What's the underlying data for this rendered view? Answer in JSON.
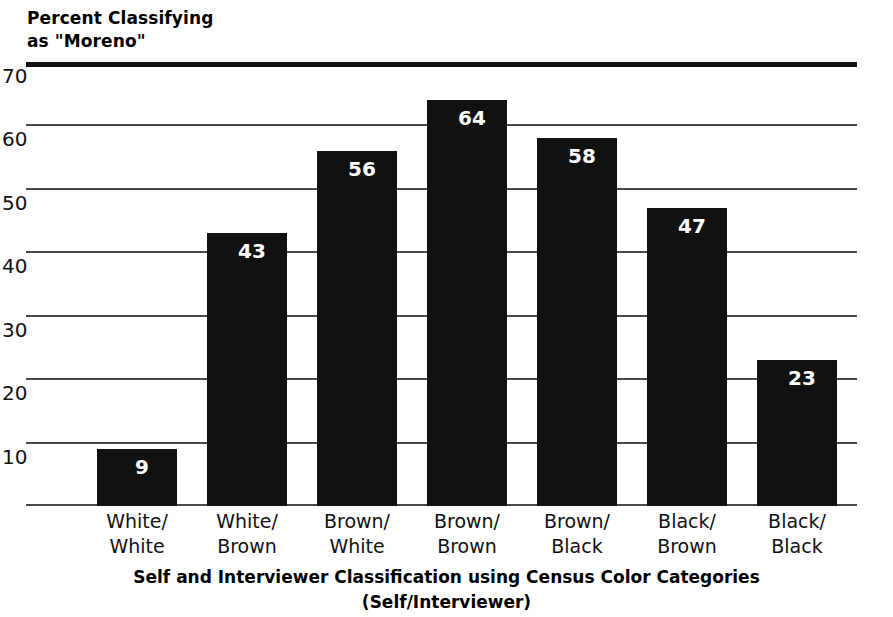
{
  "chart_data": {
    "type": "bar",
    "title": "",
    "ylabel": "Percent Classifying as \"Moreno\"",
    "ylabel_lines": [
      "Percent Classifying",
      "as \"Moreno\""
    ],
    "xlabel": "Self and Interviewer Classification using Census Color Categories (Self/Interviewer)",
    "xlabel_lines": [
      "Self and Interviewer Classification using Census Color Categories",
      "(Self/Interviewer)"
    ],
    "categories": [
      "White/White",
      "White/Brown",
      "Brown/White",
      "Brown/Brown",
      "Brown/Black",
      "Black/Brown",
      "Black/Black"
    ],
    "category_lines": [
      [
        "White/",
        "White"
      ],
      [
        "White/",
        "Brown"
      ],
      [
        "Brown/",
        "White"
      ],
      [
        "Brown/",
        "Brown"
      ],
      [
        "Brown/",
        "Black"
      ],
      [
        "Black/",
        "Brown"
      ],
      [
        "Black/",
        "Black"
      ]
    ],
    "values": [
      9,
      43,
      56,
      64,
      58,
      47,
      23
    ],
    "value_labels": [
      "9",
      "43",
      "56",
      "64",
      "58",
      "47",
      "23"
    ],
    "ylim": [
      0,
      70
    ],
    "yticks": [
      0,
      10,
      20,
      30,
      40,
      50,
      60,
      70
    ],
    "ytick_labels": [
      "",
      "10",
      "20",
      "30",
      "40",
      "50",
      "60",
      "70"
    ],
    "grid": true,
    "legend": "none",
    "bar_color": "#111111",
    "value_label_color": "#ffffff",
    "grid_color": "#4a4a4a",
    "background_color": "#ffffff"
  }
}
